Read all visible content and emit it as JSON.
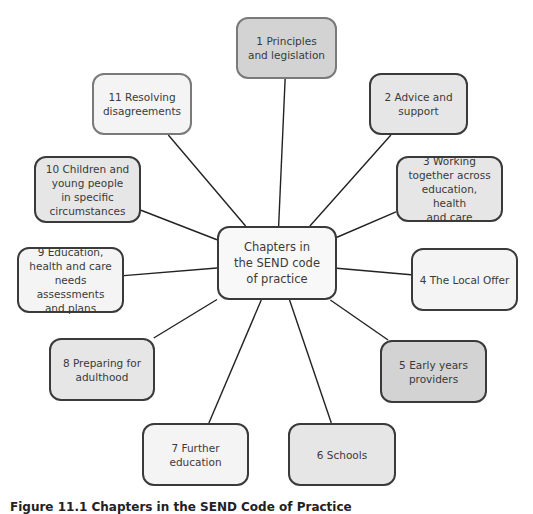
{
  "diagram": {
    "center": {
      "label": "Chapters in\nthe SEND code\nof practice"
    },
    "chapters": [
      {
        "label": "1 Principles\nand legislation"
      },
      {
        "label": "2 Advice and\nsupport"
      },
      {
        "label": "3 Working\ntogether across\neducation, health\nand care"
      },
      {
        "label": "4 The Local Offer"
      },
      {
        "label": "5 Early years\nproviders"
      },
      {
        "label": "6 Schools"
      },
      {
        "label": "7 Further\neducation"
      },
      {
        "label": "8 Preparing for\nadulthood"
      },
      {
        "label": "9 Education,\nhealth and care\nneeds assessments\nand plans"
      },
      {
        "label": "10 Children and\nyoung people\nin specific\ncircumstances"
      },
      {
        "label": "11 Resolving\ndisagreements"
      }
    ],
    "caption": "Figure 11.1 Chapters in the SEND Code of Practice"
  }
}
